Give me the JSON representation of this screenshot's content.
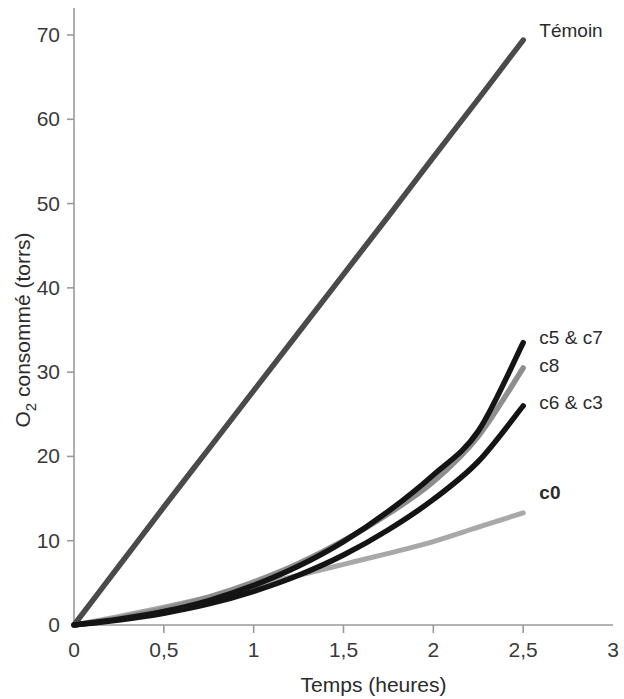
{
  "chart_data": {
    "type": "line",
    "title": "",
    "xlabel": "Temps (heures)",
    "ylabel": "O2 consommé (torrs)",
    "ylabel_main": "O",
    "ylabel_sub": "2",
    "ylabel_rest": " consommé (torrs)",
    "xlim": [
      0,
      3
    ],
    "ylim": [
      0,
      72
    ],
    "grid": false,
    "legend_position": "right-inline",
    "x_ticks": [
      "0",
      "0,5",
      "1",
      "1,5",
      "2",
      "2,5",
      "3"
    ],
    "x_tick_values": [
      0,
      0.5,
      1,
      1.5,
      2,
      2.5,
      3
    ],
    "y_ticks": [
      "0",
      "10",
      "20",
      "30",
      "40",
      "50",
      "60",
      "70"
    ],
    "y_tick_values": [
      0,
      10,
      20,
      30,
      40,
      50,
      60,
      70
    ],
    "x": [
      0,
      0.25,
      0.5,
      0.75,
      1,
      1.25,
      1.5,
      1.75,
      2,
      2.25,
      2.5
    ],
    "series": [
      {
        "name": "Témoin",
        "label": "Témoin",
        "color": "#4a4a4a",
        "width": 5.5,
        "bold_label": false,
        "label_x": 2.59,
        "label_y": 70.6,
        "values": [
          0.0,
          7.0,
          14.0,
          20.9,
          27.8,
          34.7,
          41.6,
          48.5,
          55.5,
          62.4,
          69.4
        ]
      },
      {
        "name": "c5 & c7",
        "label": "c5 & c7",
        "color": "#141414",
        "width": 5.5,
        "bold_label": false,
        "label_x": 2.59,
        "label_y": 34.2,
        "values": [
          0.0,
          0.7,
          1.6,
          2.9,
          4.7,
          7.0,
          9.9,
          13.5,
          17.8,
          23.0,
          33.5
        ]
      },
      {
        "name": "c8",
        "label": "c8",
        "color": "#8e8e8e",
        "width": 5.5,
        "bold_label": false,
        "label_x": 2.59,
        "label_y": 30.8,
        "values": [
          0.0,
          0.8,
          1.9,
          3.3,
          5.1,
          7.3,
          10.0,
          13.2,
          17.0,
          22.4,
          30.5
        ]
      },
      {
        "name": "c6 & c3",
        "label": "c6 & c3",
        "color": "#141414",
        "width": 5.5,
        "bold_label": false,
        "label_x": 2.59,
        "label_y": 26.5,
        "values": [
          0.0,
          0.6,
          1.4,
          2.5,
          4.0,
          5.9,
          8.3,
          11.3,
          14.9,
          19.4,
          26.0
        ]
      },
      {
        "name": "c0",
        "label": "c0",
        "color": "#a8a8a8",
        "width": 5.0,
        "bold_label": true,
        "label_x": 2.59,
        "label_y": 15.8,
        "values": [
          0.0,
          1.0,
          2.1,
          3.3,
          4.6,
          5.9,
          7.2,
          8.5,
          9.9,
          11.6,
          13.3
        ]
      }
    ]
  },
  "axes": {
    "x_axis_name": "x-axis",
    "y_axis_name": "y-axis"
  }
}
